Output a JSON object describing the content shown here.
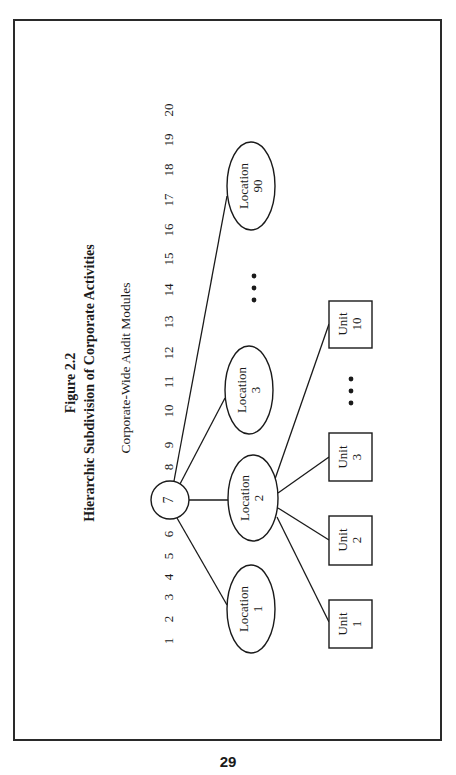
{
  "figure": {
    "label": "Figure 2.2",
    "title": "Hierarchic Subdivision of Corporate Activities",
    "axis_caption": "Corporate-Wide Audit Modules"
  },
  "module_numbers": [
    "1",
    "2",
    "3",
    "4",
    "5",
    "6",
    "7",
    "8",
    "9",
    "10",
    "11",
    "12",
    "13",
    "14",
    "15",
    "16",
    "17",
    "18",
    "19",
    "20"
  ],
  "root": {
    "label": "7"
  },
  "locations": [
    {
      "line1": "Location",
      "line2": "1"
    },
    {
      "line1": "Location",
      "line2": "2"
    },
    {
      "line1": "Location",
      "line2": "3"
    },
    {
      "line1": "Location",
      "line2": "90"
    }
  ],
  "units": [
    {
      "line1": "Unit",
      "line2": "1"
    },
    {
      "line1": "Unit",
      "line2": "2"
    },
    {
      "line1": "Unit",
      "line2": "3"
    },
    {
      "line1": "Unit",
      "line2": "10"
    }
  ],
  "ellipsis": "• • •",
  "page_number": "29",
  "colors": {
    "ink": "#1a1a1a",
    "paper": "#ffffff"
  }
}
